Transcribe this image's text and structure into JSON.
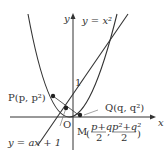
{
  "diagram": {
    "axis_labels": {
      "x": "x",
      "y": "y",
      "origin": "O",
      "one": "1"
    },
    "curve_label": "y = x²",
    "line_label": "y = ax + 1",
    "points": {
      "P": "P(p, p²)",
      "Q": "Q(q, q²)",
      "M_prefix": "M",
      "M_x_num": "p+q",
      "M_x_den": "2",
      "M_y_num": "p²+q²",
      "M_y_den": "2"
    },
    "colors": {
      "line": "#333333",
      "background": "#ffffff"
    }
  }
}
